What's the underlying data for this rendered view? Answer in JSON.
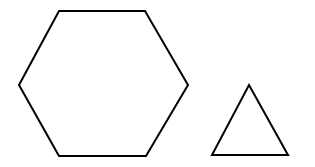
{
  "canvas": {
    "width": 315,
    "height": 167,
    "background_color": "#ffffff",
    "description": "Two black outlined geometric shapes on a plain white background: a large regular hexagon on the left and a smaller equilateral triangle on the right."
  },
  "style": {
    "stroke_color": "#000000",
    "stroke_width": 2,
    "fill": "none"
  },
  "shapes": [
    {
      "id": "hexagon",
      "name": "hexagon",
      "sides": 6,
      "label": "Hexagon",
      "stroke_color": "#000000",
      "stroke_width": 2,
      "fill": "none",
      "points": "59,11 145,11 188,85 146,156 59,156 19,85",
      "vertices": [
        {
          "x": 59,
          "y": 11
        },
        {
          "x": 145,
          "y": 11
        },
        {
          "x": 188,
          "y": 85
        },
        {
          "x": 146,
          "y": 156
        },
        {
          "x": 59,
          "y": 156
        },
        {
          "x": 19,
          "y": 85
        }
      ],
      "bounds": {
        "x": 19,
        "y": 11,
        "width": 169,
        "height": 145
      }
    },
    {
      "id": "triangle",
      "name": "triangle",
      "sides": 3,
      "label": "Triangle",
      "stroke_color": "#000000",
      "stroke_width": 2,
      "fill": "none",
      "points": "249,85 288,155 212,155",
      "vertices": [
        {
          "x": 249,
          "y": 85
        },
        {
          "x": 288,
          "y": 155
        },
        {
          "x": 212,
          "y": 155
        }
      ],
      "bounds": {
        "x": 212,
        "y": 85,
        "width": 76,
        "height": 70
      }
    }
  ]
}
